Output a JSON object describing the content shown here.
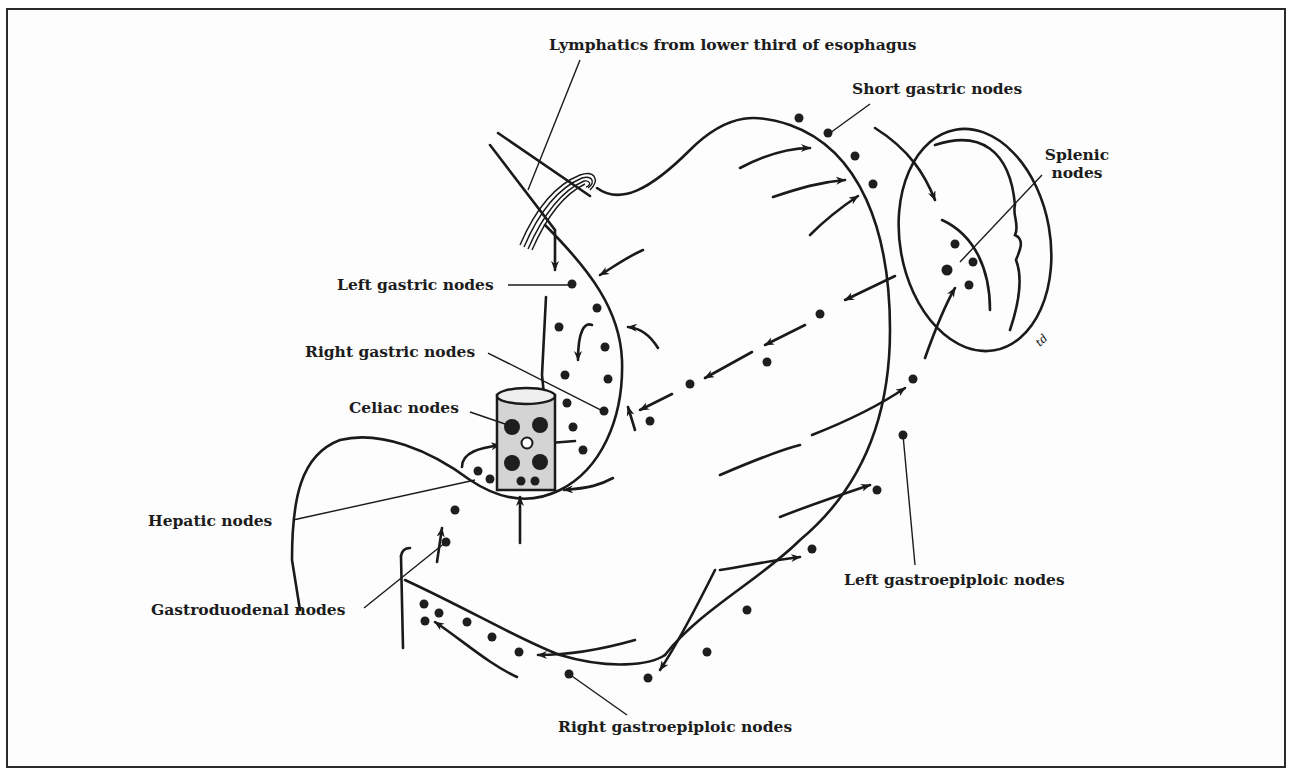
{
  "figure": {
    "labels": {
      "esophagus_lymphatics": "Lymphatics from lower third of esophagus",
      "short_gastric": "Short gastric nodes",
      "splenic_line1": "Splenic",
      "splenic_line2": "nodes",
      "left_gastric": "Left gastric nodes",
      "right_gastric": "Right gastric nodes",
      "celiac": "Celiac nodes",
      "hepatic": "Hepatic nodes",
      "gastroduodenal": "Gastroduodenal nodes",
      "left_gastroepiploic": "Left gastroepiploic nodes",
      "right_gastroepiploic": "Right gastroepiploic nodes"
    },
    "signature": "td",
    "colors": {
      "ink": "#1a1a1a",
      "background": "#ffffff",
      "celiac_fill": "#d4d4d4"
    }
  }
}
